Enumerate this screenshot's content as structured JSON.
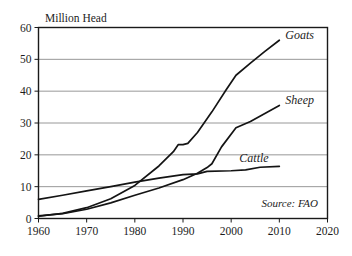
{
  "chart_data": {
    "type": "line",
    "title": "",
    "ylabel": "Million Head",
    "xlabel": "",
    "xlim": [
      1960,
      2020
    ],
    "ylim": [
      0,
      60
    ],
    "grid": "horizontal",
    "legend_position": "inline-right-of-line-ends",
    "xticks": [
      "1960",
      "1970",
      "1980",
      "1990",
      "2000",
      "2010",
      "2020"
    ],
    "yticks": [
      "0",
      "10",
      "20",
      "30",
      "40",
      "50",
      "60"
    ],
    "annotations": [
      "Source: FAO"
    ],
    "source_note": "Source: FAO",
    "series": [
      {
        "name": "Goats",
        "label": "Goats",
        "x": [
          1960,
          1965,
          1970,
          1975,
          1980,
          1985,
          1988,
          1989,
          1990,
          1991,
          1993,
          1996,
          1999,
          2001,
          2004,
          2007,
          2010
        ],
        "values": [
          0.7,
          1.6,
          3.4,
          6.2,
          10.4,
          16.5,
          21.0,
          23.2,
          23.2,
          23.6,
          27.0,
          33.5,
          40.5,
          45.0,
          48.8,
          52.5,
          56.0
        ]
      },
      {
        "name": "Sheep",
        "label": "Sheep",
        "x": [
          1960,
          1965,
          1970,
          1975,
          1980,
          1985,
          1990,
          1993,
          1995,
          1996,
          1998,
          2001,
          2004,
          2007,
          2010
        ],
        "values": [
          0.8,
          1.5,
          2.9,
          4.9,
          7.3,
          9.6,
          12.2,
          14.2,
          16.0,
          17.2,
          22.5,
          28.5,
          30.5,
          33.0,
          35.5
        ]
      },
      {
        "name": "Cattle",
        "label": "Cattle",
        "x": [
          1960,
          1965,
          1970,
          1975,
          1980,
          1985,
          1990,
          1993,
          1995,
          2000,
          2003,
          2006,
          2010
        ],
        "values": [
          6.0,
          7.3,
          8.7,
          10.0,
          11.4,
          12.7,
          13.8,
          14.0,
          14.8,
          15.0,
          15.3,
          16.1,
          16.4
        ]
      }
    ]
  }
}
